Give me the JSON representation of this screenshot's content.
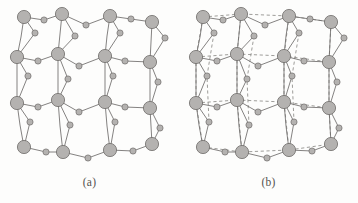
{
  "figure": {
    "type": "crystal-lattice-diagram",
    "background_color": "#fdfdfc",
    "panels": [
      {
        "id": "a",
        "caption": "(a)",
        "description": "Perovskite-type unit cell framework drawn with solid bonds only",
        "has_dashed_bonds": false
      },
      {
        "id": "b",
        "caption": "(b)",
        "description": "Same framework with additional dashed lines outlining the cubic cell edges",
        "has_dashed_bonds": true
      }
    ],
    "atoms": {
      "large": {
        "label": "large-sphere",
        "fill_color": "#b4b2b0",
        "stroke_color": "#6e6c6a",
        "radius_px": 6.6,
        "count_per_panel": 16
      },
      "small": {
        "label": "small-sphere",
        "fill_color": "#b4b2b0",
        "stroke_color": "#6e6c6a",
        "radius_px": 3.1,
        "count_per_panel": 28
      }
    },
    "bonds": {
      "solid_color": "#6e6c6a",
      "dashed_color": "#8d8b88",
      "stroke_width_px": 0.85,
      "dash_pattern": "3.2 2.6"
    },
    "large_atom_grid": [
      {
        "row": 0,
        "points": [
          [
            24,
            17
          ],
          [
            62,
            14
          ],
          [
            110,
            16
          ],
          [
            152,
            22
          ]
        ]
      },
      {
        "row": 1,
        "points": [
          [
            17,
            57
          ],
          [
            58,
            54
          ],
          [
            105,
            56
          ],
          [
            150,
            62
          ]
        ]
      },
      {
        "row": 2,
        "points": [
          [
            17,
            103
          ],
          [
            58,
            100
          ],
          [
            105,
            102
          ],
          [
            150,
            108
          ]
        ]
      },
      {
        "row": 3,
        "points": [
          [
            24,
            147
          ],
          [
            63,
            152
          ],
          [
            110,
            150
          ],
          [
            152,
            144
          ]
        ]
      }
    ],
    "small_atom_positions": [
      [
        44,
        20
      ],
      [
        86,
        25
      ],
      [
        131,
        19
      ],
      [
        35,
        33
      ],
      [
        75,
        36
      ],
      [
        120,
        33
      ],
      [
        165,
        38
      ],
      [
        38,
        61
      ],
      [
        79,
        66
      ],
      [
        125,
        61
      ],
      [
        28,
        76
      ],
      [
        68,
        79
      ],
      [
        113,
        76
      ],
      [
        158,
        82
      ],
      [
        38,
        107
      ],
      [
        79,
        112
      ],
      [
        125,
        107
      ],
      [
        30,
        122
      ],
      [
        70,
        125
      ],
      [
        115,
        122
      ],
      [
        160,
        128
      ],
      [
        46,
        152
      ],
      [
        88,
        158
      ],
      [
        133,
        151
      ]
    ]
  }
}
